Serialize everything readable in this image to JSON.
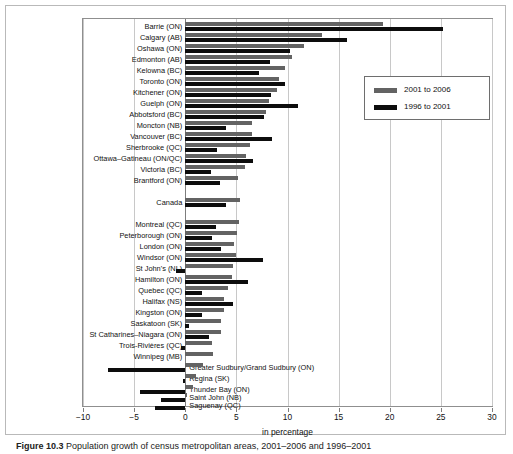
{
  "figure": {
    "caption_prefix": "Figure 10.3",
    "caption_text": "Population growth of census metropolitan areas, 2001–2006 and 1996–2001"
  },
  "legend": {
    "position": "top-right-inside",
    "entries": [
      {
        "label": "2001 to 2006",
        "color": "#636363"
      },
      {
        "label": "1996 to 2001",
        "color": "#0d0d0d"
      }
    ]
  },
  "axis": {
    "xlabel": "in percentage",
    "xticks": [
      -10,
      -5,
      0,
      5,
      10,
      15,
      20,
      25,
      30
    ],
    "xtick_labels": [
      "−10",
      "−5",
      "0",
      "5",
      "10",
      "15",
      "20",
      "25",
      "30"
    ],
    "xlim": [
      -10,
      30
    ],
    "grid": true
  },
  "chart_data": {
    "type": "bar",
    "orientation": "horizontal",
    "title": "Population growth of census metropolitan areas, 2001–2006 and 1996–2001",
    "xlabel": "in percentage",
    "ylabel": "",
    "xlim": [
      -10,
      30
    ],
    "grid": true,
    "legend_position": "upper right",
    "categories": [
      "Barrie (ON)",
      "Calgary (AB)",
      "Oshawa (ON)",
      "Edmonton (AB)",
      "Kelowna (BC)",
      "Toronto (ON)",
      "Kitchener (ON)",
      "Guelph (ON)",
      "Abbotsford (BC)",
      "Moncton (NB)",
      "Vancouver (BC)",
      "Sherbrooke (QC)",
      "Ottawa–Gatineau (ON/QC)",
      "Victoria (BC)",
      "Brantford (ON)",
      "Canada",
      "Montreal (QC)",
      "Peterborough (ON)",
      "London (ON)",
      "Windsor (ON)",
      "St John's (NL)",
      "Hamilton (ON)",
      "Quebec (QC)",
      "Halifax (NS)",
      "Kingston (ON)",
      "Saskatoon (SK)",
      "St Catharines–Niagara (ON)",
      "Trois-Rivières (QC)",
      "Winnipeg (MB)",
      "Greater Sudbury/Grand Sudbury (ON)",
      "Regina (SK)",
      "Thunder Bay (ON)",
      "Saint John (NB)",
      "Saguenay (QC)"
    ],
    "series": [
      {
        "name": "2001 to 2006",
        "color": "#636363",
        "values": [
          19.3,
          13.4,
          11.6,
          10.4,
          9.8,
          9.2,
          9.0,
          8.2,
          7.9,
          6.5,
          6.5,
          6.3,
          5.9,
          5.8,
          5.2,
          5.4,
          5.3,
          5.1,
          4.8,
          5.0,
          4.7,
          4.6,
          4.2,
          3.8,
          3.8,
          3.5,
          3.5,
          2.6,
          2.7,
          1.7,
          1.1,
          0.8,
          0.2,
          0.0
        ],
        "bar_color_name": "gray"
      },
      {
        "name": "1996 to 2001",
        "color": "#0d0d0d",
        "values": [
          25.2,
          15.8,
          10.2,
          8.3,
          7.2,
          9.8,
          8.4,
          11.0,
          7.7,
          4.0,
          8.5,
          3.1,
          6.6,
          2.5,
          3.4,
          4.0,
          3.0,
          2.6,
          3.5,
          7.6,
          -0.9,
          6.1,
          1.6,
          4.7,
          1.6,
          0.4,
          2.3,
          -0.4,
          0.0,
          -7.6,
          -0.2,
          -4.4,
          -2.4,
          -3.0
        ],
        "bar_color_name": "black"
      }
    ],
    "notes": [
      "Canada row is a reference row separated from the CMA list",
      "Labels for the last five categories are drawn to the right of the zero axis because their bars extend left (negative growth)"
    ]
  },
  "rows": [
    {
      "label": "Barrie (ON)",
      "g": 19.3,
      "b": 25.2,
      "side": "left",
      "y": 14
    },
    {
      "label": "Calgary (AB)",
      "g": 13.4,
      "b": 15.8,
      "side": "left",
      "y": 25
    },
    {
      "label": "Oshawa (ON)",
      "g": 11.6,
      "b": 10.2,
      "side": "left",
      "y": 36
    },
    {
      "label": "Edmonton (AB)",
      "g": 10.4,
      "b": 8.3,
      "side": "left",
      "y": 47
    },
    {
      "label": "Kelowna (BC)",
      "g": 9.8,
      "b": 7.2,
      "side": "left",
      "y": 58
    },
    {
      "label": "Toronto (ON)",
      "g": 9.2,
      "b": 9.8,
      "side": "left",
      "y": 69
    },
    {
      "label": "Kitchener (ON)",
      "g": 9.0,
      "b": 8.4,
      "side": "left",
      "y": 80
    },
    {
      "label": "Guelph (ON)",
      "g": 8.2,
      "b": 11.0,
      "side": "left",
      "y": 91
    },
    {
      "label": "Abbotsford (BC)",
      "g": 7.9,
      "b": 7.7,
      "side": "left",
      "y": 102
    },
    {
      "label": "Moncton (NB)",
      "g": 6.5,
      "b": 4.0,
      "side": "left",
      "y": 113
    },
    {
      "label": "Vancouver (BC)",
      "g": 6.5,
      "b": 8.5,
      "side": "left",
      "y": 124
    },
    {
      "label": "Sherbrooke (QC)",
      "g": 6.3,
      "b": 3.1,
      "side": "left",
      "y": 135
    },
    {
      "label": "Ottawa–Gatineau (ON/QC)",
      "g": 5.9,
      "b": 6.6,
      "side": "left",
      "y": 146
    },
    {
      "label": "Victoria (BC)",
      "g": 5.8,
      "b": 2.5,
      "side": "left",
      "y": 157
    },
    {
      "label": "Brantford (ON)",
      "g": 5.2,
      "b": 3.4,
      "side": "left",
      "y": 168
    },
    {
      "label": "Canada",
      "g": 5.4,
      "b": 4.0,
      "side": "left",
      "y": 190
    },
    {
      "label": "Montreal (QC)",
      "g": 5.3,
      "b": 3.0,
      "side": "left",
      "y": 212
    },
    {
      "label": "Peterborough (ON)",
      "g": 5.1,
      "b": 2.6,
      "side": "left",
      "y": 223
    },
    {
      "label": "London (ON)",
      "g": 4.8,
      "b": 3.5,
      "side": "left",
      "y": 234
    },
    {
      "label": "Windsor (ON)",
      "g": 5.0,
      "b": 7.6,
      "side": "left",
      "y": 245
    },
    {
      "label": "St John's (NL)",
      "g": 4.7,
      "b": -0.9,
      "side": "left",
      "y": 256
    },
    {
      "label": "Hamilton (ON)",
      "g": 4.6,
      "b": 6.1,
      "side": "left",
      "y": 267
    },
    {
      "label": "Quebec (QC)",
      "g": 4.2,
      "b": 1.6,
      "side": "left",
      "y": 278
    },
    {
      "label": "Halifax (NS)",
      "g": 3.8,
      "b": 4.7,
      "side": "left",
      "y": 289
    },
    {
      "label": "Kingston (ON)",
      "g": 3.8,
      "b": 1.6,
      "side": "left",
      "y": 300
    },
    {
      "label": "Saskatoon (SK)",
      "g": 3.5,
      "b": 0.4,
      "side": "left",
      "y": 311
    },
    {
      "label": "St Catharines–Niagara (ON)",
      "g": 3.5,
      "b": 2.3,
      "side": "left",
      "y": 322
    },
    {
      "label": "Trois-Rivières (QC)",
      "g": 2.6,
      "b": -0.4,
      "side": "left",
      "y": 333
    },
    {
      "label": "Winnipeg (MB)",
      "g": 2.7,
      "b": 0.0,
      "side": "left",
      "y": 344
    },
    {
      "label": "Greater Sudbury/Grand Sudbury (ON)",
      "g": 1.7,
      "b": -7.6,
      "side": "right",
      "y": 355
    },
    {
      "label": "Regina (SK)",
      "g": 1.1,
      "b": -0.2,
      "side": "right",
      "y": 366
    },
    {
      "label": "Thunder Bay (ON)",
      "g": 0.8,
      "b": -4.4,
      "side": "right",
      "y": 377
    },
    {
      "label": "Saint John (NB)",
      "g": 0.2,
      "b": -2.4,
      "side": "right",
      "y": 385
    },
    {
      "label": "Saguenay (QC)",
      "g": 0.0,
      "b": -3.0,
      "side": "right",
      "y": 393
    }
  ]
}
